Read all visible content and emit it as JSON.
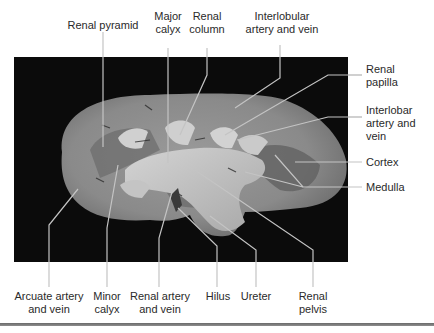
{
  "figure": {
    "type": "labeled-specimen-photo",
    "labels": {
      "renal_pyramid": [
        "Renal pyramid"
      ],
      "major_calyx": [
        "Major",
        "calyx"
      ],
      "renal_column": [
        "Renal",
        "column"
      ],
      "interlobular": [
        "Interlobular",
        "artery and vein"
      ],
      "renal_papilla": [
        "Renal",
        "papilla"
      ],
      "interlobar": [
        "Interlobar",
        "artery and",
        "vein"
      ],
      "cortex": [
        "Cortex"
      ],
      "medulla": [
        "Medulla"
      ],
      "arcuate": [
        "Arcuate artery",
        "and vein"
      ],
      "minor_calyx": [
        "Minor",
        "calyx"
      ],
      "renal_artery": [
        "Renal artery",
        "and vein"
      ],
      "hilus": [
        "Hilus"
      ],
      "ureter": [
        "Ureter"
      ],
      "renal_pelvis": [
        "Renal",
        "pelvis"
      ]
    },
    "colors": {
      "background": "#ffffff",
      "photo_background": "#0a0a0a",
      "tissue_light": "#c9c9c9",
      "tissue_mid": "#8d8d8d",
      "tissue_dark": "#5e5e5e",
      "leader_line": "#bdbdbd",
      "text": "#2a2a2a",
      "rule": "#7a7a7a"
    }
  }
}
